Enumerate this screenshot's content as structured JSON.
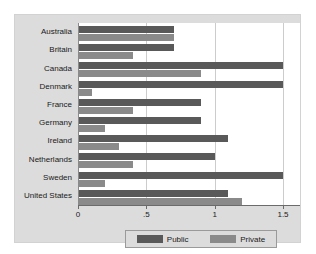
{
  "chart_data": {
    "type": "bar",
    "orientation": "horizontal",
    "title": "",
    "xlabel": "",
    "ylabel": "",
    "xlim": [
      0,
      1.5
    ],
    "xticks": [
      "0",
      ".5",
      "1",
      "1.5"
    ],
    "xtick_values": [
      0,
      0.5,
      1,
      1.5
    ],
    "grid": true,
    "grid_axis": "x",
    "legend_position": "bottom",
    "categories": [
      "Australia",
      "Britain",
      "Canada",
      "Denmark",
      "France",
      "Germany",
      "Ireland",
      "Netherlands",
      "Sweden",
      "United States"
    ],
    "series": [
      {
        "name": "Public",
        "color": "#595959",
        "values": [
          0.7,
          0.7,
          1.5,
          1.5,
          0.9,
          0.9,
          1.1,
          1.0,
          1.5,
          1.1
        ]
      },
      {
        "name": "Private",
        "color": "#8a8a8a",
        "values": [
          0.7,
          0.4,
          0.9,
          0.1,
          0.4,
          0.2,
          0.3,
          0.4,
          0.2,
          1.2
        ]
      }
    ]
  },
  "legend": {
    "entries": [
      {
        "label": "Public"
      },
      {
        "label": "Private"
      }
    ]
  },
  "colors": {
    "panel_background": "#dcdcdc",
    "plot_background": "#ffffff",
    "public_bar": "#595959",
    "private_bar": "#8a8a8a",
    "gridline": "#cccccc",
    "axis": "#6b6b6b",
    "text": "#1a1a1a"
  }
}
